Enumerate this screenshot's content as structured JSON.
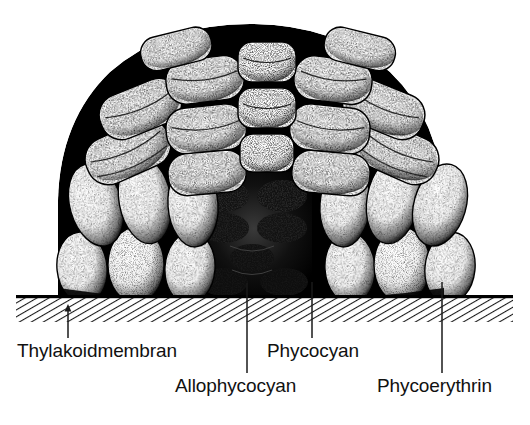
{
  "figure": {
    "kind": "phycobilisome-cross-section-diagram",
    "title_visible": false,
    "background_color": "#ffffff",
    "ink_color": "#000000"
  },
  "labels": {
    "thylakoid": "Thylakoidmembran",
    "phycocyan": "Phycocyan",
    "allophycocyan": "Allophycocyan",
    "phycoerythrin": "Phycoerythrin"
  },
  "leaders": {
    "thylakoid": {
      "x": 68,
      "y_top": 306,
      "y_bottom": 338,
      "arrowhead": "up"
    },
    "allophycocyan": {
      "x": 247,
      "y_top": 283,
      "y_bottom": 373,
      "arrowhead": "none"
    },
    "phycocyan": {
      "x": 312,
      "y_top": 282,
      "y_bottom": 338,
      "arrowhead": "none"
    },
    "phycoerythrin": {
      "x": 442,
      "y_top": 282,
      "y_bottom": 373,
      "arrowhead": "none"
    }
  },
  "membrane": {
    "name": "thylakoid membrane band",
    "x_left": 16,
    "x_right": 513,
    "y_top": 296,
    "y_bottom": 322,
    "top_rule_thickness": 3,
    "fill": "diagonal-hatch",
    "hatch_angle_deg": 60,
    "hatch_color": "#1a1a1a"
  },
  "structure": {
    "name": "phycobilisome",
    "x_left": 58,
    "x_right": 444,
    "y_top": 28,
    "y_bottom": 297,
    "core_color": "#000000",
    "rod_fill": "#ffffff",
    "style": "stippled pen-and-ink",
    "core": {
      "name": "allophycocyanin core",
      "x_center": 250,
      "y_center": 240,
      "description": "dark heavily stippled cylinders at the base centre"
    },
    "rods": [
      {
        "id": "r1",
        "group": "top-center-left",
        "cx": 205,
        "cy": 70,
        "rx": 40,
        "ry": 22,
        "rot": -6,
        "kind": "cylinder"
      },
      {
        "id": "r2",
        "group": "top-center",
        "cx": 268,
        "cy": 62,
        "rx": 34,
        "ry": 21,
        "rot": 0,
        "kind": "cylinder"
      },
      {
        "id": "r3",
        "group": "top-center-right",
        "cx": 330,
        "cy": 70,
        "rx": 40,
        "ry": 22,
        "rot": 6,
        "kind": "cylinder"
      },
      {
        "id": "r4",
        "group": "top-left",
        "cx": 148,
        "cy": 95,
        "rx": 42,
        "ry": 24,
        "rot": -26,
        "kind": "cylinder"
      },
      {
        "id": "r5",
        "group": "top-right",
        "cx": 388,
        "cy": 95,
        "rx": 42,
        "ry": 24,
        "rot": 26,
        "kind": "cylinder"
      },
      {
        "id": "r6",
        "group": "mid-center-left",
        "cx": 205,
        "cy": 128,
        "rx": 40,
        "ry": 22,
        "rot": -4,
        "kind": "cylinder"
      },
      {
        "id": "r7",
        "group": "mid-center",
        "cx": 268,
        "cy": 122,
        "rx": 34,
        "ry": 21,
        "rot": 0,
        "kind": "cylinder"
      },
      {
        "id": "r8",
        "group": "mid-center-right",
        "cx": 330,
        "cy": 128,
        "rx": 40,
        "ry": 22,
        "rot": 4,
        "kind": "cylinder"
      },
      {
        "id": "r9",
        "group": "mid-left",
        "cx": 128,
        "cy": 150,
        "rx": 44,
        "ry": 25,
        "rot": -22,
        "kind": "cylinder"
      },
      {
        "id": "r10",
        "group": "mid-right",
        "cx": 408,
        "cy": 150,
        "rx": 44,
        "ry": 25,
        "rot": 22,
        "kind": "cylinder"
      },
      {
        "id": "r11",
        "group": "lower-left-outer",
        "cx": 96,
        "cy": 205,
        "rx": 26,
        "ry": 42,
        "rot": -14,
        "kind": "ellipse"
      },
      {
        "id": "r12",
        "group": "lower-left",
        "cx": 145,
        "cy": 200,
        "rx": 26,
        "ry": 44,
        "rot": -10,
        "kind": "ellipse"
      },
      {
        "id": "r13",
        "group": "lower-left-in",
        "cx": 193,
        "cy": 205,
        "rx": 26,
        "ry": 42,
        "rot": -4,
        "kind": "ellipse"
      },
      {
        "id": "r14",
        "group": "lower-right-in",
        "cx": 345,
        "cy": 205,
        "rx": 26,
        "ry": 42,
        "rot": 4,
        "kind": "ellipse"
      },
      {
        "id": "r15",
        "group": "lower-right",
        "cx": 393,
        "cy": 200,
        "rx": 26,
        "ry": 44,
        "rot": 10,
        "kind": "ellipse"
      },
      {
        "id": "r16",
        "group": "lower-right-outer",
        "cx": 438,
        "cy": 205,
        "rx": 26,
        "ry": 42,
        "rot": 14,
        "kind": "ellipse"
      },
      {
        "id": "r17",
        "group": "base-left-outer",
        "cx": 82,
        "cy": 268,
        "rx": 25,
        "ry": 36,
        "rot": -6,
        "kind": "ellipse"
      },
      {
        "id": "r18",
        "group": "base-left",
        "cx": 136,
        "cy": 265,
        "rx": 28,
        "ry": 38,
        "rot": 0,
        "kind": "ellipse"
      },
      {
        "id": "r19",
        "group": "base-left-in",
        "cx": 190,
        "cy": 268,
        "rx": 25,
        "ry": 36,
        "rot": 4,
        "kind": "ellipse"
      },
      {
        "id": "r20",
        "group": "base-right-in",
        "cx": 350,
        "cy": 268,
        "rx": 25,
        "ry": 36,
        "rot": -4,
        "kind": "ellipse"
      },
      {
        "id": "r21",
        "group": "base-right",
        "cx": 402,
        "cy": 265,
        "rx": 28,
        "ry": 38,
        "rot": 0,
        "kind": "ellipse"
      },
      {
        "id": "r22",
        "group": "base-right-outer",
        "cx": 452,
        "cy": 268,
        "rx": 25,
        "ry": 36,
        "rot": 6,
        "kind": "ellipse"
      }
    ]
  }
}
